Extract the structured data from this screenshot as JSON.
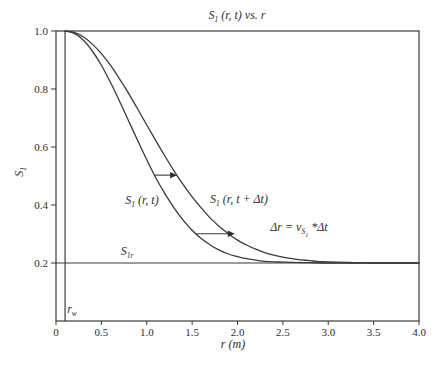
{
  "chart_data": {
    "type": "line",
    "xlabel": "r (m)",
    "ylabel": "S₁",
    "xlim": [
      0,
      4.0
    ],
    "ylim": [
      0,
      1.0
    ],
    "grid": false,
    "legend_position": "none (inline curve labels)",
    "x_ticks": {
      "values": [
        0,
        0.5,
        1.0,
        1.5,
        2.0,
        2.5,
        3.0,
        3.5,
        4.0
      ],
      "labels": [
        "0",
        "0.5",
        "1.0",
        "1.5",
        "2.0",
        "2.5",
        "3.0",
        "3.5",
        "4.0"
      ]
    },
    "y_ticks": {
      "values": [
        0.2,
        0.4,
        0.6,
        0.8,
        1.0
      ],
      "labels": [
        "0.2",
        "0.4",
        "0.6",
        "0.8",
        "1.0"
      ]
    },
    "residual_saturation_S1r": 0.2,
    "well_radius_rw": 0.1,
    "series": [
      {
        "id": "s1-r-t",
        "name": "S₁ (r, t)",
        "points": [
          [
            0.1,
            1.0
          ],
          [
            0.2,
            0.992
          ],
          [
            0.3,
            0.969
          ],
          [
            0.4,
            0.931
          ],
          [
            0.5,
            0.882
          ],
          [
            0.6,
            0.823
          ],
          [
            0.7,
            0.758
          ],
          [
            0.8,
            0.69
          ],
          [
            0.9,
            0.622
          ],
          [
            1.0,
            0.556
          ],
          [
            1.1,
            0.494
          ],
          [
            1.2,
            0.439
          ],
          [
            1.3,
            0.39
          ],
          [
            1.4,
            0.348
          ],
          [
            1.5,
            0.313
          ],
          [
            1.6,
            0.284
          ],
          [
            1.7,
            0.262
          ],
          [
            1.8,
            0.244
          ],
          [
            1.9,
            0.231
          ],
          [
            2.0,
            0.222
          ],
          [
            2.1,
            0.215
          ],
          [
            2.2,
            0.21
          ],
          [
            2.3,
            0.206
          ],
          [
            2.4,
            0.204
          ],
          [
            2.5,
            0.203
          ],
          [
            2.6,
            0.202
          ],
          [
            2.8,
            0.201
          ],
          [
            3.0,
            0.2
          ],
          [
            3.5,
            0.2
          ],
          [
            4.0,
            0.2
          ]
        ]
      },
      {
        "id": "s1-r-t-plus-dt",
        "name": "S₁ (r, t + Δt)",
        "points": [
          [
            0.1,
            1.0
          ],
          [
            0.2,
            0.995
          ],
          [
            0.3,
            0.98
          ],
          [
            0.4,
            0.955
          ],
          [
            0.5,
            0.922
          ],
          [
            0.6,
            0.882
          ],
          [
            0.7,
            0.835
          ],
          [
            0.8,
            0.785
          ],
          [
            0.9,
            0.731
          ],
          [
            1.0,
            0.676
          ],
          [
            1.1,
            0.622
          ],
          [
            1.2,
            0.569
          ],
          [
            1.3,
            0.518
          ],
          [
            1.4,
            0.471
          ],
          [
            1.5,
            0.428
          ],
          [
            1.6,
            0.39
          ],
          [
            1.7,
            0.355
          ],
          [
            1.8,
            0.326
          ],
          [
            1.9,
            0.301
          ],
          [
            2.0,
            0.279
          ],
          [
            2.1,
            0.262
          ],
          [
            2.2,
            0.248
          ],
          [
            2.3,
            0.236
          ],
          [
            2.4,
            0.227
          ],
          [
            2.5,
            0.22
          ],
          [
            2.6,
            0.215
          ],
          [
            2.7,
            0.211
          ],
          [
            2.8,
            0.208
          ],
          [
            2.9,
            0.205
          ],
          [
            3.0,
            0.204
          ],
          [
            3.1,
            0.203
          ],
          [
            3.2,
            0.202
          ],
          [
            3.3,
            0.201
          ],
          [
            3.4,
            0.201
          ],
          [
            3.5,
            0.2
          ],
          [
            4.0,
            0.2
          ]
        ]
      }
    ],
    "reference_lines": [
      {
        "id": "s1r-line",
        "orientation": "horizontal",
        "value": 0.2,
        "label": "S₁ᵣ"
      },
      {
        "id": "rw-line",
        "orientation": "vertical",
        "value": 0.1,
        "label": "rʷ"
      }
    ],
    "arrows": [
      {
        "id": "front-shift-upper",
        "from": [
          1.085,
          0.503
        ],
        "to": [
          1.335,
          0.503
        ]
      },
      {
        "id": "front-shift-lower",
        "from": [
          1.542,
          0.301
        ],
        "to": [
          1.97,
          0.301
        ]
      }
    ]
  },
  "labels": {
    "title": {
      "pre": "S",
      "sub": "1",
      "post": " (r, t) vs. r"
    },
    "ylabel": {
      "pre": "S",
      "sub": "1",
      "post": ""
    },
    "xlabel": "r (m)",
    "curve1": {
      "pre": "S",
      "sub": "1",
      "post": " (r, t)"
    },
    "curve2": {
      "pre": "S",
      "sub": "1",
      "post": " (r, t + Δt)"
    },
    "s1r": {
      "pre": "S",
      "sub": "1r",
      "post": ""
    },
    "rw": {
      "pre": "r",
      "sub": "w",
      "post": ""
    },
    "delta": {
      "pre": "Δr = v",
      "sub": "S",
      "subsub": "1",
      "post": " *Δt"
    }
  },
  "colors": {
    "line": "#3a3a3a",
    "text": "#2e2e2e",
    "background": "#ffffff"
  }
}
